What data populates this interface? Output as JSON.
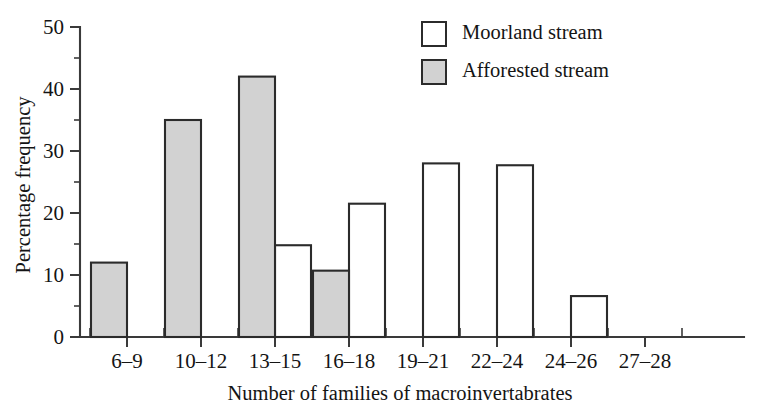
{
  "chart_data": {
    "type": "bar",
    "title": "",
    "xlabel": "Number of families of macroinvertabrates",
    "ylabel": "Percentage frequency",
    "categories": [
      "6–9",
      "10–12",
      "13–15",
      "16–18",
      "19–21",
      "22–24",
      "24–26",
      "27–28"
    ],
    "series": [
      {
        "name": "Moorland stream",
        "style": "open",
        "color": "#ffffff",
        "values": [
          0,
          0,
          14.8,
          21.5,
          28.0,
          27.7,
          6.6,
          0
        ]
      },
      {
        "name": "Afforested stream",
        "style": "filled",
        "color": "#d2d2d2",
        "values": [
          12.0,
          35.0,
          42.0,
          10.7,
          0,
          0,
          0,
          0
        ]
      }
    ],
    "ylim": [
      0,
      50
    ],
    "ytick_labels": [
      "0",
      "10",
      "20",
      "30",
      "40",
      "50"
    ],
    "ytick_values": [
      0,
      10,
      20,
      30,
      40,
      50
    ],
    "yminor_values": [
      5,
      15,
      25,
      35,
      45
    ],
    "grid": false,
    "legend_position": "top-right"
  },
  "legend": {
    "entries": [
      {
        "label": "Moorland stream",
        "swatch": "open"
      },
      {
        "label": "Afforested stream",
        "swatch": "filled"
      }
    ]
  },
  "colors": {
    "axis": "#3a3a3a",
    "outline": "#2b2b2b",
    "fill_gray": "#d2d2d2",
    "fill_white": "#ffffff",
    "text": "#141414"
  }
}
